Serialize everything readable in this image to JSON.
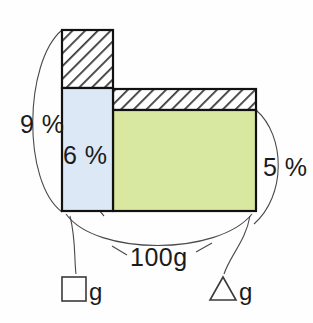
{
  "figure": {
    "type": "stacked-bar-concentration-diagram",
    "background_color": "#fefefe",
    "bars": [
      {
        "id": "left-bar",
        "name": "square-solution-bar",
        "x": 62,
        "y": 29,
        "width": 51,
        "height": 182,
        "segments": [
          {
            "id": "left-bar-solute",
            "fill_pattern": "diagonal-hatch",
            "fill_color": "#ffffff",
            "percent_label": "9 %"
          },
          {
            "id": "left-bar-solvent",
            "fill_pattern": "solid",
            "fill_color": "#dce8f5",
            "percent_label": "6 %"
          }
        ]
      },
      {
        "id": "right-bar",
        "name": "triangle-solution-bar",
        "x": 113,
        "y": 88,
        "width": 143,
        "height": 123,
        "segments": [
          {
            "id": "right-bar-solute",
            "fill_pattern": "diagonal-hatch",
            "fill_color": "#ffffff"
          },
          {
            "id": "right-bar-solvent",
            "fill_pattern": "solid",
            "fill_color": "#d9e8a0",
            "percent_label": "5 %"
          }
        ]
      }
    ],
    "labels": {
      "left_total_percent": "9 %",
      "left_inner_percent": "6 %",
      "right_percent": "5 %",
      "total_mass": "100g",
      "left_mass": "g",
      "right_mass": "g"
    },
    "symbols": {
      "left_mass_symbol": "square",
      "right_mass_symbol": "triangle"
    },
    "colors": {
      "blue_fill": "#dce8f5",
      "green_fill": "#d9e8a0",
      "outline": "#111111",
      "arc": "#4a4a4a",
      "hatch": "#3c3c3c",
      "text": "#1b1b1b"
    }
  }
}
